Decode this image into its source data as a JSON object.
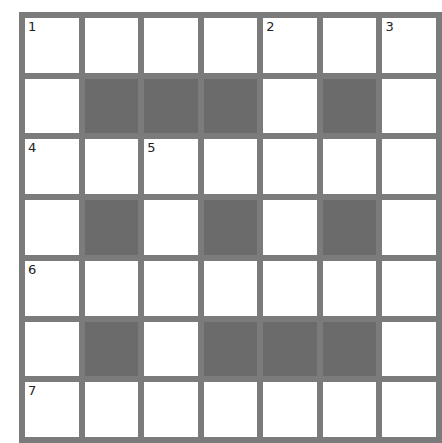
{
  "puzzle": {
    "rows": 7,
    "cols": 7,
    "colors": {
      "grid_line": "#7b7b7b",
      "black_cell": "#6b6b6b",
      "white_cell": "#ffffff"
    },
    "layout": [
      "WWWWWWW",
      "WBBBWBW",
      "WWWWWWW",
      "WBWBWBW",
      "WWWWWWW",
      "WBWBBBW",
      "WWWWWWW"
    ],
    "numbers": {
      "r0c0": "1",
      "r0c4": "2",
      "r0c6": "3",
      "r2c0": "4",
      "r2c2": "5",
      "r4c0": "6",
      "r6c0": "7"
    }
  }
}
